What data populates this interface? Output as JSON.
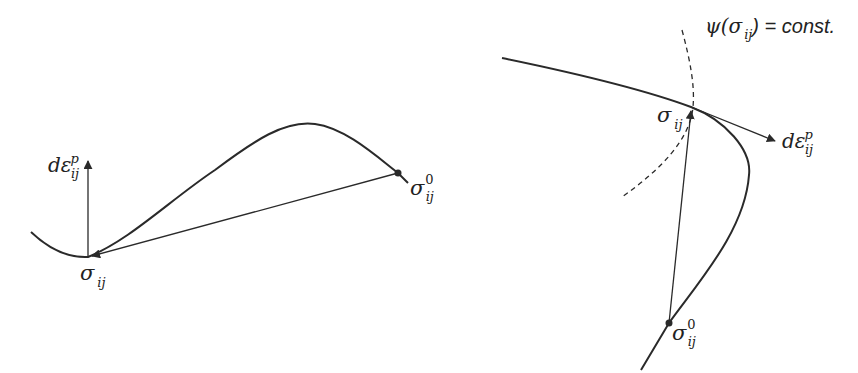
{
  "figure": {
    "panels": [
      {
        "id": "left",
        "description": "Plastic strain increment direction relative to stress path from initial stress to current stress",
        "labels": {
          "strain_increment": {
            "base": "dε",
            "superscript": "p",
            "subscript": "ij"
          },
          "current_stress": {
            "base": "σ",
            "subscript": "ij"
          },
          "initial_stress": {
            "base": "σ",
            "superscript": "0",
            "subscript": "ij"
          }
        }
      },
      {
        "id": "right",
        "description": "Strain increment tangent at stress point with plastic potential surface",
        "labels": {
          "potential": {
            "prefix": "ψ(",
            "base": "σ",
            "subscript": "ij",
            "suffix": ") = const."
          },
          "strain_increment": {
            "base": "dε",
            "superscript": "p",
            "subscript": "ij"
          },
          "current_stress": {
            "base": "σ",
            "subscript": "ij"
          },
          "initial_stress": {
            "base": "σ",
            "superscript": "0",
            "subscript": "ij"
          }
        }
      }
    ],
    "colors": {
      "stroke": "#2a2a2a",
      "background": "#ffffff"
    }
  }
}
